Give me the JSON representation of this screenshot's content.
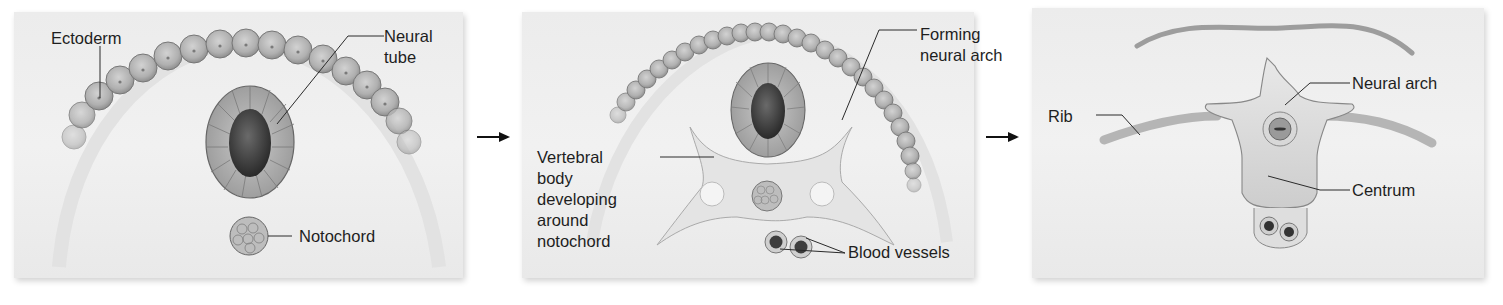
{
  "figure": {
    "stages": [
      {
        "id": "stage-1",
        "labels": {
          "ectoderm": "Ectoderm",
          "neural_tube_1": "Neural",
          "neural_tube_2": "tube",
          "notochord": "Notochord"
        }
      },
      {
        "id": "stage-2",
        "labels": {
          "forming_1": "Forming",
          "forming_2": "neural arch",
          "vertebral_1": "Vertebral",
          "vertebral_2": "body",
          "vertebral_3": "developing",
          "vertebral_4": "around",
          "vertebral_5": "notochord",
          "blood_vessels": "Blood vessels"
        }
      },
      {
        "id": "stage-3",
        "labels": {
          "rib": "Rib",
          "neural_arch": "Neural arch",
          "centrum": "Centrum"
        }
      }
    ],
    "arrows": [
      "arrow-right-icon",
      "arrow-right-icon"
    ],
    "colors": {
      "panel_bg": "#eeeeee",
      "cell_fill": "#b9b9b9",
      "cell_stroke": "#6d6d6d",
      "tube_lumen": "#3d3d3d",
      "bone_fill": "#e3e3e3",
      "text": "#1e1e1e"
    }
  }
}
